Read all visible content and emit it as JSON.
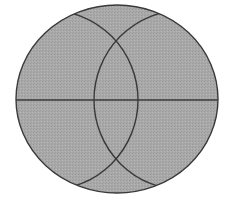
{
  "diagram": {
    "colors": {
      "background": "#ffffff",
      "fill": "#a9a9a9",
      "stroke": "#3a3a3a"
    },
    "outer_circle": {
      "cx": 117,
      "cy": 99,
      "rx": 101,
      "ry": 94
    },
    "horizontal_line": {
      "x1": 16,
      "y1": 100,
      "x2": 218,
      "y2": 100
    },
    "left_arc": {
      "cx": 48,
      "cy": 100,
      "r": 90
    },
    "right_arc": {
      "cx": 184,
      "cy": 100,
      "r": 90
    }
  }
}
